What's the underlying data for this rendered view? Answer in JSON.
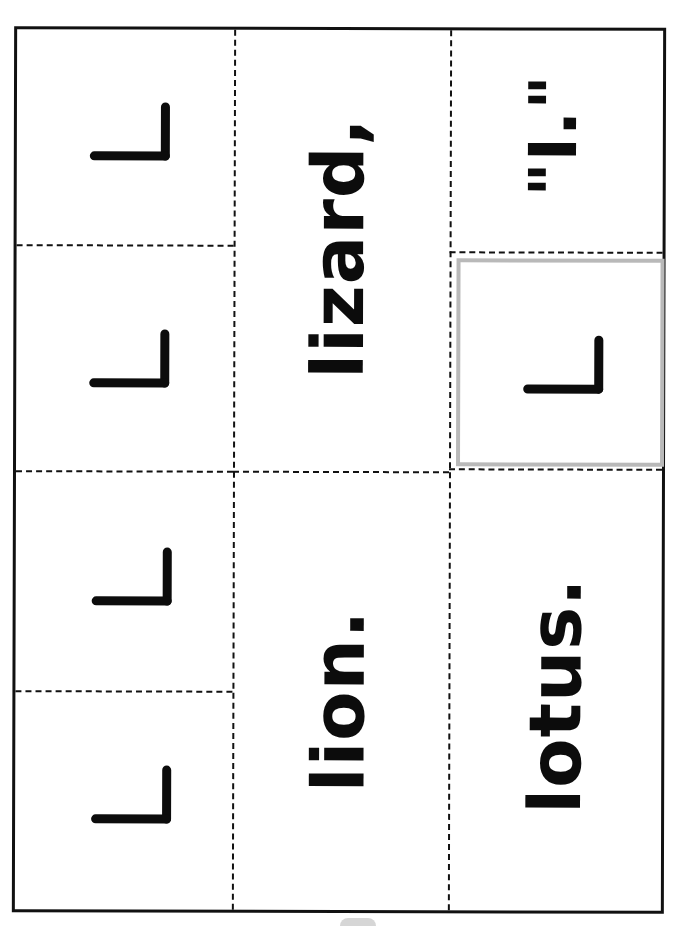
{
  "page": {
    "orientation": "rotated-90-ccw",
    "background": "#ffffff",
    "line_color": "#111111",
    "selected_cell_border": "#b9b9b9"
  },
  "cards": {
    "left_column": [
      {
        "label": "L",
        "glyph": "letter-L-rotated"
      },
      {
        "label": "L",
        "glyph": "letter-L-rotated"
      },
      {
        "label": "L",
        "glyph": "letter-L-rotated"
      },
      {
        "label": "L",
        "glyph": "letter-L-rotated"
      }
    ],
    "middle_column": [
      {
        "text": "lizard,"
      },
      {
        "text": "lion."
      }
    ],
    "right_column": [
      {
        "text": "\"I.\""
      },
      {
        "label": "L",
        "glyph": "letter-L-rotated",
        "selected": true
      },
      {
        "text": "lotus."
      }
    ]
  }
}
